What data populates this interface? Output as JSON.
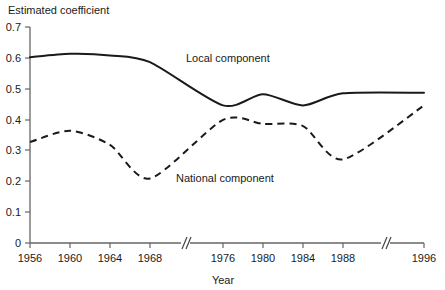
{
  "chart_data": {
    "type": "line",
    "title": "",
    "ylabel": "Estimated coefficient",
    "xlabel": "Year",
    "ylim": [
      0,
      0.7
    ],
    "ytick_labels": [
      "0",
      "0.1",
      "0.2",
      "0.3",
      "0.4",
      "0.5",
      "0.6",
      "0.7"
    ],
    "ytick_values": [
      0,
      0.1,
      0.2,
      0.3,
      0.4,
      0.5,
      0.6,
      0.7
    ],
    "xtick_labels": [
      "1956",
      "1960",
      "1964",
      "1968",
      "1976",
      "1980",
      "1984",
      "1988",
      "1996"
    ],
    "x": [
      1956,
      1960,
      1964,
      1968,
      1976,
      1980,
      1984,
      1988,
      1996
    ],
    "grid": false,
    "legend_position": "inline-annotation",
    "axis_breaks": 2,
    "series": [
      {
        "name": "Local component",
        "style": "solid",
        "color": "#1a1a1a",
        "values": [
          0.602,
          0.613,
          0.608,
          0.586,
          0.446,
          0.482,
          0.446,
          0.485,
          0.487
        ]
      },
      {
        "name": "National component",
        "style": "dashed",
        "color": "#1a1a1a",
        "values": [
          0.327,
          0.364,
          0.318,
          0.209,
          0.399,
          0.386,
          0.379,
          0.271,
          0.446
        ]
      }
    ],
    "annotations": [
      {
        "text": "Local component",
        "x_px": 186,
        "y_px": 62
      },
      {
        "text": "National component",
        "x_px": 176,
        "y_px": 182
      }
    ]
  }
}
